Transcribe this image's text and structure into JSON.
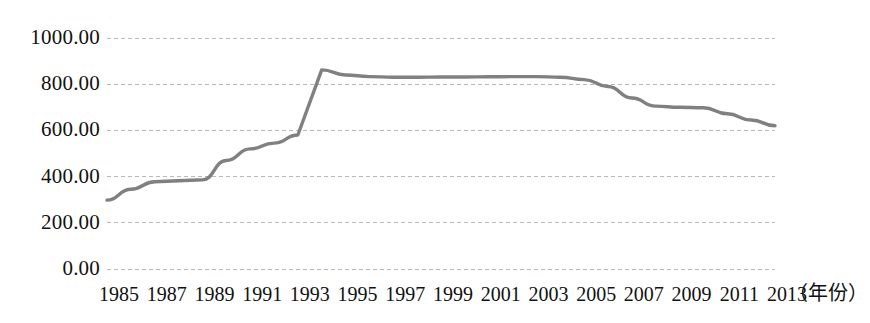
{
  "chart_data": {
    "type": "line",
    "title": "",
    "subtitle": "",
    "xlabel": "（年份）",
    "ylabel": "",
    "xlim": [
      1985,
      2013
    ],
    "ylim": [
      0,
      1000
    ],
    "grid": true,
    "grid_axis": "y",
    "legend": false,
    "legend_position": "none",
    "line_color": "#808080",
    "gridline_color": "#b9b9b9",
    "text_color": "#111111",
    "background_color": "#ffffff",
    "ytick_labels": [
      "1000.00",
      "800.00",
      "600.00",
      "400.00",
      "200.00",
      "0.00"
    ],
    "ytick_values": [
      1000,
      800,
      600,
      400,
      200,
      0
    ],
    "xtick_labels": [
      "1985",
      "1987",
      "1989",
      "1991",
      "1993",
      "1995",
      "1997",
      "1999",
      "2001",
      "2003",
      "2005",
      "2007",
      "2009",
      "2011",
      "2013"
    ],
    "xtick_values": [
      1985,
      1987,
      1989,
      1991,
      1993,
      1995,
      1997,
      1999,
      2001,
      2003,
      2005,
      2007,
      2009,
      2011,
      2013
    ],
    "x": [
      1985,
      1986,
      1987,
      1988,
      1989,
      1990,
      1991,
      1992,
      1993,
      1994,
      1995,
      1996,
      1997,
      1998,
      1999,
      2000,
      2001,
      2002,
      2003,
      2004,
      2005,
      2006,
      2007,
      2008,
      2009,
      2010,
      2011,
      2012,
      2013
    ],
    "values": [
      298,
      345,
      378,
      382,
      386,
      470,
      520,
      545,
      580,
      862,
      840,
      833,
      830,
      830,
      831,
      831,
      832,
      833,
      833,
      830,
      820,
      790,
      740,
      705,
      700,
      698,
      672,
      645,
      620
    ],
    "series": [
      {
        "name": "series-1",
        "color": "#808080",
        "values": [
          298,
          345,
          378,
          382,
          386,
          470,
          520,
          545,
          580,
          862,
          840,
          833,
          830,
          830,
          831,
          831,
          832,
          833,
          833,
          830,
          820,
          790,
          740,
          705,
          700,
          698,
          672,
          645,
          620
        ]
      }
    ],
    "annotations": []
  }
}
